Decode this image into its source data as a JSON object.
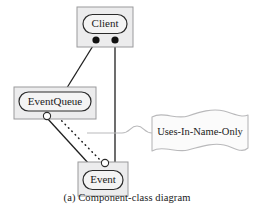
{
  "figure": {
    "caption": "(a) Component-class diagram",
    "background_color": "#ffffff"
  },
  "style": {
    "component_fill": "#ececed",
    "component_stroke": "#9a9a9c",
    "label_fill": "#f2f2f2",
    "label_stroke": "#2b2b2b",
    "connector_stroke": "#1f1f1f",
    "note_stroke": "#b9b9bb",
    "note_fill": "#fbfbfb",
    "note_connector_stroke": "#b9b9bb",
    "port_ball_fill": "#111111",
    "port_socket_fill": "#ffffff",
    "text_color": "#1a1a1a"
  },
  "components": [
    {
      "id": "client",
      "label": "Client",
      "box": {
        "x": 77,
        "y": 7,
        "w": 56,
        "h": 40
      },
      "label_shape": {
        "cx": 105,
        "cy": 24,
        "rx": 22,
        "ry": 9.5
      },
      "ports": [
        {
          "kind": "ball",
          "name": "client-port-left",
          "cx": 96,
          "cy": 40,
          "r": 3.6
        },
        {
          "kind": "ball",
          "name": "client-port-right",
          "cx": 115,
          "cy": 40,
          "r": 3.6
        }
      ]
    },
    {
      "id": "eventqueue",
      "label": "EventQueue",
      "box": {
        "x": 14,
        "y": 87,
        "w": 82,
        "h": 32
      },
      "label_shape": {
        "cx": 55,
        "cy": 101,
        "rx": 37,
        "ry": 9.5
      },
      "ports": [
        {
          "kind": "socket",
          "name": "eventqueue-socket",
          "cx": 47,
          "cy": 116,
          "r": 3.6
        }
      ]
    },
    {
      "id": "event",
      "label": "Event",
      "box": {
        "x": 78,
        "y": 162,
        "w": 50,
        "h": 34
      },
      "label_shape": {
        "cx": 103,
        "cy": 180,
        "rx": 20,
        "ry": 9.5
      },
      "ports": [
        {
          "kind": "socket",
          "name": "event-socket",
          "cx": 105,
          "cy": 163,
          "r": 3.6
        }
      ]
    }
  ],
  "connectors": [
    {
      "name": "client-to-eventqueue",
      "style": "solid",
      "from": "client-port-left",
      "to": "eventqueue-label"
    },
    {
      "name": "client-to-event",
      "style": "solid",
      "from": "client-port-right",
      "to": "event-socket"
    },
    {
      "name": "eventqueue-to-event",
      "style": "solid",
      "from": "eventqueue-socket",
      "to": "event-box"
    },
    {
      "name": "eventqueue-uses-event",
      "style": "dotted",
      "from": "eventqueue",
      "to": "event-socket"
    }
  ],
  "note": {
    "text": "Uses-In-Name-Only",
    "shape": {
      "x": 152,
      "y": 112,
      "w": 95,
      "h": 42
    },
    "anchor_target": "eventqueue-to-event-connector"
  }
}
